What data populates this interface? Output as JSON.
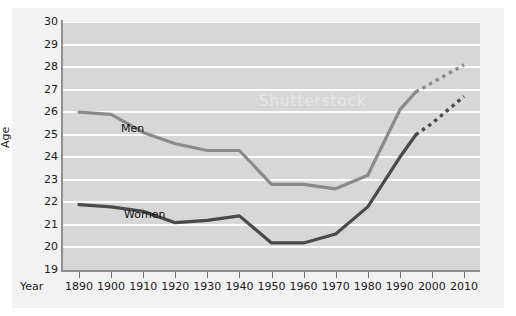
{
  "figure": {
    "background_color": "#ffffff",
    "panel_color": "#f2f2f2",
    "plot_background_color": "#d7d7d7",
    "gridline_color": "#fbfbfb",
    "axis_color": "#8f8f8f",
    "watermark_text": "Shutterstock"
  },
  "chart_data": {
    "type": "line",
    "title": "",
    "subtitle": "",
    "xlabel": "Year",
    "ylabel": "Age",
    "xlim": [
      1885,
      2015
    ],
    "ylim": [
      19,
      30
    ],
    "grid": true,
    "legend_position": "inline-annotation",
    "x_ticks": [
      1890,
      1900,
      1910,
      1920,
      1930,
      1940,
      1950,
      1960,
      1970,
      1980,
      1990,
      2000,
      2010
    ],
    "x_tick_labels": [
      "1890",
      "1900",
      "1910",
      "1920",
      "1930",
      "1940",
      "1950",
      "1960",
      "1970",
      "1980",
      "1990",
      "2000",
      "2010"
    ],
    "y_ticks": [
      19,
      20,
      21,
      22,
      23,
      24,
      25,
      26,
      27,
      28,
      29,
      30
    ],
    "y_tick_labels": [
      "19",
      "20",
      "21",
      "22",
      "23",
      "24",
      "25",
      "26",
      "27",
      "28",
      "29",
      "30"
    ],
    "series": [
      {
        "name": "Men",
        "color": "#8a8a8a",
        "label": "Men",
        "style": "solid",
        "x": [
          1890,
          1900,
          1910,
          1920,
          1930,
          1940,
          1950,
          1960,
          1970,
          1980,
          1990,
          1995
        ],
        "values": [
          26.0,
          25.9,
          25.1,
          24.6,
          24.3,
          24.3,
          22.8,
          22.8,
          22.6,
          23.2,
          26.1,
          26.9
        ]
      },
      {
        "name": "Men (projected)",
        "color": "#8a8a8a",
        "label": "",
        "style": "dotted",
        "x": [
          1995,
          2000,
          2010
        ],
        "values": [
          26.9,
          27.3,
          28.1
        ]
      },
      {
        "name": "Women",
        "color": "#4a4a4a",
        "label": "Women",
        "style": "solid",
        "x": [
          1890,
          1900,
          1910,
          1920,
          1930,
          1940,
          1950,
          1960,
          1970,
          1980,
          1990,
          1995
        ],
        "values": [
          21.9,
          21.8,
          21.6,
          21.1,
          21.2,
          21.4,
          20.2,
          20.2,
          20.6,
          21.8,
          24.0,
          25.0
        ]
      },
      {
        "name": "Women (projected)",
        "color": "#4a4a4a",
        "label": "",
        "style": "dotted",
        "x": [
          1995,
          2000,
          2010
        ],
        "values": [
          25.0,
          25.5,
          26.7
        ]
      }
    ]
  }
}
